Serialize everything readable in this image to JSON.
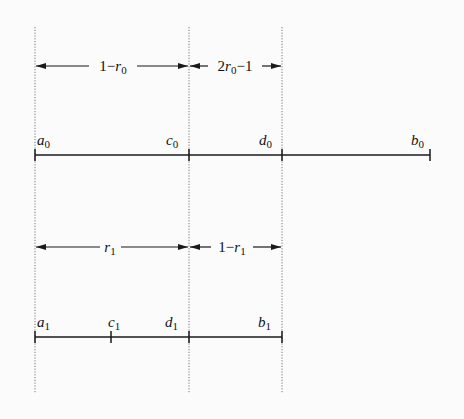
{
  "diagram": {
    "guides_x": [
      35,
      189,
      282
    ],
    "top_interval": {
      "points": [
        {
          "name": "a",
          "sub": "0",
          "x": 35
        },
        {
          "name": "c",
          "sub": "0",
          "x": 189
        },
        {
          "name": "d",
          "sub": "0",
          "x": 282
        },
        {
          "name": "b",
          "sub": "0",
          "x": 430
        }
      ],
      "dimensions": [
        {
          "pre": "1−",
          "var": "r",
          "sub": "0",
          "post": "",
          "x1": 35,
          "x2": 189
        },
        {
          "pre": "2",
          "var": "r",
          "sub": "0",
          "post": "−1",
          "x1": 189,
          "x2": 282
        }
      ]
    },
    "bottom_interval": {
      "points": [
        {
          "name": "a",
          "sub": "1",
          "x": 35
        },
        {
          "name": "c",
          "sub": "1",
          "x": 111
        },
        {
          "name": "d",
          "sub": "1",
          "x": 189
        },
        {
          "name": "b",
          "sub": "1",
          "x": 282
        }
      ],
      "dimensions": [
        {
          "pre": "",
          "var": "r",
          "sub": "1",
          "post": "",
          "x1": 35,
          "x2": 189
        },
        {
          "pre": "1−",
          "var": "r",
          "sub": "1",
          "post": "",
          "x1": 189,
          "x2": 282
        }
      ]
    },
    "colors": {
      "line": "#1a1a1a",
      "guide": "#777777",
      "background": "#fbfbfb"
    }
  }
}
